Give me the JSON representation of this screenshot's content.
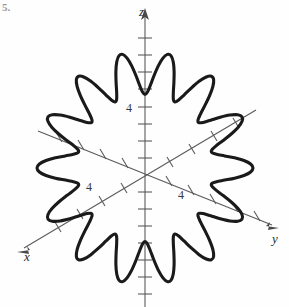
{
  "figure": {
    "problem_number": "5.",
    "background_color": "#fefefe",
    "curve_color": "#1a1a1a",
    "axis_color": "#5a5a5a"
  },
  "axes": {
    "z": {
      "label": "z",
      "tick_label": "4",
      "direction": "up"
    },
    "y": {
      "label": "y",
      "tick_label": "4",
      "direction": "lower-right"
    },
    "x": {
      "label": "x",
      "tick_label": "4",
      "direction": "lower-left"
    }
  },
  "chart_data": {
    "type": "line",
    "title": "",
    "xlabel": "y",
    "ylabel": "z",
    "zlabel": "x",
    "grid": false,
    "legend": null,
    "projection": "3d-axes",
    "origin_px": [
      145,
      175
    ],
    "tick_spacing_px": 17,
    "tick_count": {
      "z_up": 8,
      "z_down": 7,
      "y": 8,
      "x": 8
    },
    "labeled_ticks": [
      {
        "axis": "z",
        "value": 4
      },
      {
        "axis": "y",
        "value": 4
      },
      {
        "axis": "x",
        "value": 4
      }
    ],
    "curve": {
      "name": "rose-curve",
      "description": "closed flower-shaped curve with fourteen petals centered at the origin",
      "form": "r = a + b*cos(14*theta)",
      "petals": 14,
      "r_mean_px": 88,
      "r_amplitude_px": 20,
      "r_max_px": 108,
      "r_min_px": 68,
      "phase_deg": 90,
      "center_px": [
        145,
        168
      ],
      "squash_y": 1.08
    }
  }
}
